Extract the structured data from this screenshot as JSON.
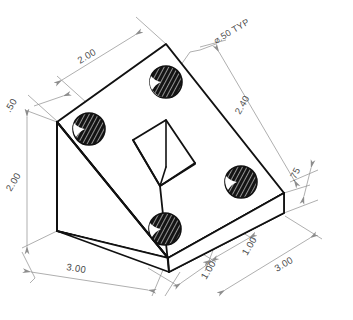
{
  "drawing": {
    "title": "Isometric view of angle bracket with four through holes",
    "view_type": "isometric",
    "units": "inches",
    "line_colors": {
      "object_line": "#111111",
      "dimension_line": "#8d8d8d",
      "hole_fill": "#141414",
      "hole_hatch": "#ffffff",
      "background": "#ffffff"
    },
    "annotations": {
      "hole_callout": "⌀.50 TYP",
      "top_width": "2.00",
      "hole_offset_left": ".50",
      "height_left": "2.00",
      "base_length_left": "3.00",
      "slope_length_right": "2.40",
      "thickness_right": ".75",
      "notch_offset_inner": "1.00",
      "notch_offset_outer": "1.00",
      "base_length_right": "3.00"
    },
    "dimension_list": [
      {
        "id": "top-width",
        "label": "2.00",
        "kind": "linear",
        "location": "top-left"
      },
      {
        "id": "hole-offset",
        "label": ".50",
        "kind": "linear",
        "location": "upper-left"
      },
      {
        "id": "height",
        "label": "2.00",
        "kind": "linear",
        "location": "far-left"
      },
      {
        "id": "base-length-left",
        "label": "3.00",
        "kind": "linear",
        "location": "bottom-left"
      },
      {
        "id": "slope-length",
        "label": "2.40",
        "kind": "linear",
        "location": "upper-right"
      },
      {
        "id": "thickness",
        "label": ".75",
        "kind": "linear",
        "location": "right"
      },
      {
        "id": "notch-inner",
        "label": "1.00",
        "kind": "linear",
        "location": "bottom-center"
      },
      {
        "id": "notch-outer",
        "label": "1.00",
        "kind": "linear",
        "location": "bottom-center"
      },
      {
        "id": "base-length-right",
        "label": "3.00",
        "kind": "linear",
        "location": "bottom-right"
      },
      {
        "id": "hole-diameter",
        "label": "⌀.50 TYP",
        "kind": "leader",
        "location": "top"
      }
    ],
    "holes": [
      {
        "id": "hole-top",
        "cx": 166,
        "cy": 82,
        "rx": 16,
        "ry": 16
      },
      {
        "id": "hole-left",
        "cx": 89,
        "cy": 129,
        "rx": 16,
        "ry": 16
      },
      {
        "id": "hole-right",
        "cx": 241,
        "cy": 182,
        "rx": 16,
        "ry": 16
      },
      {
        "id": "hole-bottom",
        "cx": 165,
        "cy": 229,
        "rx": 16,
        "ry": 16
      }
    ]
  }
}
